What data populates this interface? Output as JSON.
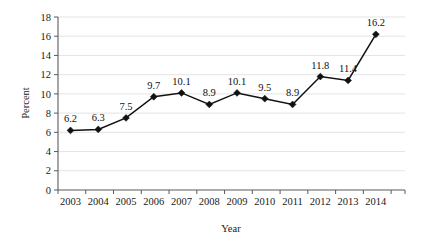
{
  "chart_data": {
    "type": "line",
    "title": "",
    "xlabel": "Year",
    "ylabel": "Percent",
    "categories": [
      "2003",
      "2004",
      "2005",
      "2006",
      "2007",
      "2008",
      "2009",
      "2010",
      "2011",
      "2012",
      "2013",
      "2014"
    ],
    "values": [
      6.2,
      6.3,
      7.5,
      9.7,
      10.1,
      8.9,
      10.1,
      9.5,
      8.9,
      11.8,
      11.4,
      16.2
    ],
    "point_labels": [
      "6.2",
      "6.3",
      "7.5",
      "9.7",
      "10.1",
      "8.9",
      "10.1",
      "9.5",
      "8.9",
      "11.8",
      "11.4",
      "16.2"
    ],
    "ylim": [
      0,
      18
    ],
    "ytick_values": [
      0,
      2,
      4,
      6,
      8,
      10,
      12,
      14,
      16,
      18
    ],
    "ytick_labels": [
      "0",
      "2",
      "4",
      "6",
      "8",
      "10",
      "12",
      "14",
      "16",
      "18"
    ],
    "grid": true,
    "grid_axis": "y",
    "legend": false,
    "legend_position": "none",
    "marker": "diamond",
    "colors": {
      "line": "#111111",
      "marker": "#111111",
      "grid": "#d8d8d8",
      "axis": "#5a5a5a",
      "text": "#1a1a1a",
      "background": "#ffffff"
    }
  },
  "axes": {
    "y_axis_title": "Percent",
    "x_axis_title": "Year"
  }
}
